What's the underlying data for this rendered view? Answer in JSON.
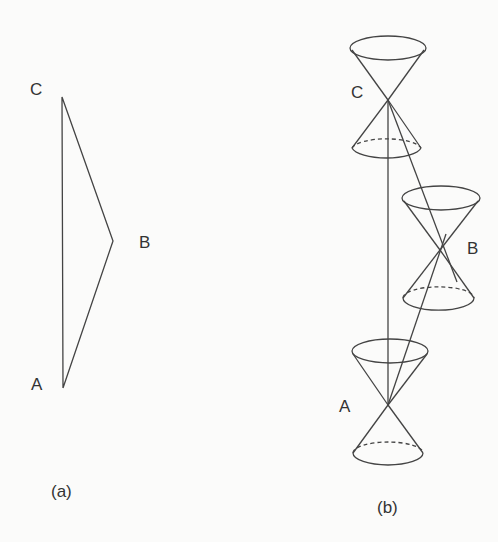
{
  "panels": [
    {
      "id": "a",
      "caption": "(a)",
      "points": {
        "A": {
          "label": "A",
          "x": 63,
          "y": 388
        },
        "B": {
          "label": "B",
          "x": 113,
          "y": 241
        },
        "C": {
          "label": "C",
          "x": 62,
          "y": 97
        }
      },
      "edges": [
        [
          "A",
          "C"
        ],
        [
          "C",
          "B"
        ],
        [
          "B",
          "A"
        ]
      ]
    },
    {
      "id": "b",
      "caption": "(b)",
      "points": {
        "A": {
          "label": "A",
          "x": 388,
          "y": 405
        },
        "B": {
          "label": "B",
          "x": 440,
          "y": 250
        },
        "C": {
          "label": "C",
          "x": 388,
          "y": 100
        }
      },
      "light_cones": [
        "A",
        "B",
        "C"
      ],
      "edges": [
        [
          "A",
          "C"
        ],
        [
          "C",
          "B"
        ],
        [
          "B",
          "A"
        ]
      ]
    }
  ],
  "colors": {
    "stroke": "#444444",
    "text": "#333333",
    "background": "#fbfbfa"
  }
}
